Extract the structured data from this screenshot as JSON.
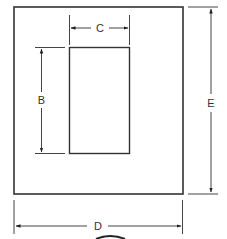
{
  "diagram": {
    "type": "dimensioned-frame-cutout",
    "colors": {
      "line": "#333333",
      "dimension": "#444444",
      "background": "#ffffff"
    },
    "outer_frame": {
      "label": "outer-frame"
    },
    "inner_opening": {
      "label": "inner-opening"
    },
    "dimensions": {
      "B": {
        "label": "B",
        "description": "opening height"
      },
      "C": {
        "label": "C",
        "description": "opening width"
      },
      "D": {
        "label": "D",
        "description": "overall width"
      },
      "E": {
        "label": "E",
        "description": "overall height"
      }
    }
  }
}
